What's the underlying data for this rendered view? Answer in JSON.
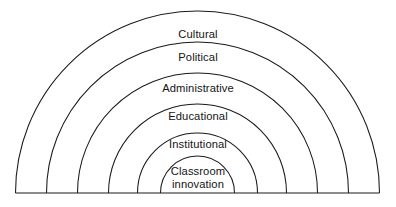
{
  "diagram": {
    "type": "nested-semicircle-layers",
    "title": "",
    "background_color": "#ffffff",
    "stroke_color": "#1a1a1a",
    "center_x": 197.5,
    "baseline_y": 193,
    "layers": [
      {
        "label": "Cultural",
        "order": 1,
        "outer_radius": 182,
        "inner_radius": 151,
        "label_y": 28
      },
      {
        "label": "Political",
        "order": 2,
        "outer_radius": 151,
        "inner_radius": 120,
        "label_y": 51
      },
      {
        "label": "Administrative",
        "order": 3,
        "outer_radius": 120,
        "inner_radius": 89,
        "label_y": 82
      },
      {
        "label": "Educational",
        "order": 4,
        "outer_radius": 89,
        "inner_radius": 60,
        "label_y": 110
      },
      {
        "label": "Institutional",
        "order": 5,
        "outer_radius": 60,
        "inner_radius": 37,
        "label_y": 138
      },
      {
        "label": "Classroom\ninnovation",
        "order": 6,
        "outer_radius": 37,
        "inner_radius": 0,
        "label_y": 165
      }
    ]
  }
}
